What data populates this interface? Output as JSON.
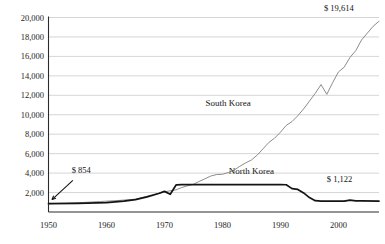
{
  "chart_data": {
    "type": "line",
    "title": "",
    "subtitle": "",
    "xlabel": "",
    "ylabel": "",
    "xlim": [
      1950,
      2007
    ],
    "ylim": [
      0,
      20000
    ],
    "grid": true,
    "legend_position": "inline-labels",
    "x_ticks": [
      "1950",
      "1960",
      "1970",
      "1980",
      "1990",
      "2000"
    ],
    "x_tick_values": [
      1950,
      1960,
      1970,
      1980,
      1990,
      2000
    ],
    "y_ticks": [
      "2,000",
      "4,000",
      "6,000",
      "8,000",
      "10,000",
      "12,000",
      "14,000",
      "16,000",
      "18,000",
      "20,000"
    ],
    "y_tick_values": [
      2000,
      4000,
      6000,
      8000,
      10000,
      12000,
      14000,
      16000,
      18000,
      20000
    ],
    "series": [
      {
        "name": "South Korea",
        "color": "#8c8c8c",
        "width": 1.0,
        "label_x": 1981,
        "label_y": 10900,
        "x": [
          1950,
          1953,
          1956,
          1959,
          1962,
          1965,
          1968,
          1970,
          1971,
          1972,
          1973,
          1974,
          1975,
          1976,
          1977,
          1978,
          1979,
          1980,
          1981,
          1982,
          1983,
          1984,
          1985,
          1986,
          1987,
          1988,
          1989,
          1990,
          1991,
          1992,
          1993,
          1994,
          1995,
          1996,
          1997,
          1998,
          1999,
          2000,
          2001,
          2002,
          2003,
          2004,
          2005,
          2006,
          2007
        ],
        "values": [
          854,
          900,
          980,
          1080,
          1180,
          1320,
          1760,
          2080,
          2180,
          2280,
          2520,
          2700,
          2850,
          3150,
          3420,
          3700,
          3850,
          3880,
          4050,
          4300,
          4700,
          5050,
          5350,
          5850,
          6500,
          7150,
          7600,
          8200,
          8900,
          9300,
          9900,
          10600,
          11400,
          12200,
          13100,
          12100,
          13300,
          14400,
          14900,
          15900,
          16600,
          17700,
          18400,
          19100,
          19614
        ]
      },
      {
        "name": "North Korea",
        "color": "#141414",
        "width": 1.7,
        "label_x": 1985,
        "label_y": 3900,
        "x": [
          1950,
          1955,
          1960,
          1963,
          1965,
          1967,
          1969,
          1970,
          1971,
          1972,
          1973,
          1980,
          1985,
          1990,
          1991,
          1992,
          1993,
          1994,
          1995,
          1996,
          1997,
          2000,
          2001,
          2002,
          2003,
          2004,
          2007
        ],
        "values": [
          854,
          880,
          960,
          1120,
          1280,
          1560,
          1900,
          2120,
          1820,
          2780,
          2820,
          2820,
          2820,
          2820,
          2800,
          2400,
          2320,
          1960,
          1480,
          1160,
          1120,
          1120,
          1120,
          1230,
          1140,
          1140,
          1122
        ]
      }
    ],
    "annotations": [
      {
        "name": "start-value-label",
        "text": "$ 854",
        "x": 1954.0,
        "y": 4050,
        "align": "start"
      },
      {
        "name": "south-korea-end-label",
        "text": "$ 19,614",
        "x": 1997.5,
        "y": 20700,
        "align": "start"
      },
      {
        "name": "north-korea-end-label",
        "text": "$ 1,122",
        "x": 1998.0,
        "y": 3050,
        "align": "start"
      }
    ],
    "arrow": {
      "name": "start-value-arrow",
      "from_x": 1954.2,
      "from_y": 3250,
      "to_x": 1950.6,
      "to_y": 1280
    }
  }
}
